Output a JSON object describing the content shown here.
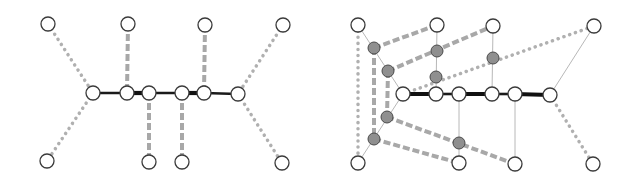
{
  "styles": {
    "thick": {
      "color": "#1a1a1a",
      "width": 2.6,
      "dash": ""
    },
    "thicker": {
      "color": "#111111",
      "width": 4.2,
      "dash": ""
    },
    "thin": {
      "color": "#b8b8b8",
      "width": 1,
      "dash": ""
    },
    "dashed": {
      "color": "#a8a8a8",
      "width": 4,
      "dash": "7 3"
    },
    "dotted": {
      "color": "#b0b0b0",
      "width": 3.5,
      "dash": "0.1 6",
      "cap": "round"
    }
  },
  "node_radius": 7,
  "aux_node_radius": 6,
  "diagrams": [
    {
      "name": "left-graph",
      "nodes": [
        {
          "id": "t1",
          "x": 48,
          "y": 24,
          "type": "open"
        },
        {
          "id": "t2",
          "x": 128,
          "y": 24,
          "type": "open"
        },
        {
          "id": "t3",
          "x": 205,
          "y": 25,
          "type": "open"
        },
        {
          "id": "t4",
          "x": 283,
          "y": 25,
          "type": "open"
        },
        {
          "id": "m1",
          "x": 93,
          "y": 93,
          "type": "open"
        },
        {
          "id": "m2",
          "x": 127,
          "y": 93,
          "type": "open"
        },
        {
          "id": "m3",
          "x": 149,
          "y": 93,
          "type": "open"
        },
        {
          "id": "m4",
          "x": 182,
          "y": 93,
          "type": "open"
        },
        {
          "id": "m5",
          "x": 204,
          "y": 93,
          "type": "open"
        },
        {
          "id": "m6",
          "x": 238,
          "y": 94,
          "type": "open"
        },
        {
          "id": "b1",
          "x": 47,
          "y": 161,
          "type": "open"
        },
        {
          "id": "b2",
          "x": 149,
          "y": 162,
          "type": "open"
        },
        {
          "id": "b3",
          "x": 182,
          "y": 162,
          "type": "open"
        },
        {
          "id": "b4",
          "x": 282,
          "y": 163,
          "type": "open"
        }
      ],
      "edges": [
        {
          "from": "m1",
          "to": "m2",
          "style": "thick"
        },
        {
          "from": "m2",
          "to": "m3",
          "style": "thicker"
        },
        {
          "from": "m3",
          "to": "m4",
          "style": "thick"
        },
        {
          "from": "m4",
          "to": "m5",
          "style": "thicker"
        },
        {
          "from": "m5",
          "to": "m6",
          "style": "thick"
        },
        {
          "from": "t1",
          "to": "m1",
          "style": "dotted"
        },
        {
          "from": "m1",
          "to": "b1",
          "style": "dotted"
        },
        {
          "from": "t4",
          "to": "m6",
          "style": "dotted"
        },
        {
          "from": "m6",
          "to": "b4",
          "style": "dotted"
        },
        {
          "from": "t2",
          "to": "m2",
          "style": "dashed"
        },
        {
          "from": "t3",
          "to": "m5",
          "style": "dashed"
        },
        {
          "from": "m3",
          "to": "b2",
          "style": "dashed"
        },
        {
          "from": "m4",
          "to": "b3",
          "style": "dashed"
        }
      ]
    },
    {
      "name": "right-graph",
      "nodes": [
        {
          "id": "t1",
          "x": 358,
          "y": 25,
          "type": "open"
        },
        {
          "id": "t2",
          "x": 437,
          "y": 25,
          "type": "open"
        },
        {
          "id": "t3",
          "x": 493,
          "y": 26,
          "type": "open"
        },
        {
          "id": "t4",
          "x": 594,
          "y": 26,
          "type": "open"
        },
        {
          "id": "m1",
          "x": 403,
          "y": 94,
          "type": "open"
        },
        {
          "id": "m2",
          "x": 436,
          "y": 94,
          "type": "open"
        },
        {
          "id": "m3",
          "x": 459,
          "y": 94,
          "type": "open"
        },
        {
          "id": "m4",
          "x": 492,
          "y": 94,
          "type": "open"
        },
        {
          "id": "m5",
          "x": 515,
          "y": 94,
          "type": "open"
        },
        {
          "id": "m6",
          "x": 550,
          "y": 95,
          "type": "open"
        },
        {
          "id": "b1",
          "x": 358,
          "y": 163,
          "type": "open"
        },
        {
          "id": "b2",
          "x": 459,
          "y": 163,
          "type": "open"
        },
        {
          "id": "b3",
          "x": 515,
          "y": 164,
          "type": "open"
        },
        {
          "id": "b4",
          "x": 593,
          "y": 164,
          "type": "open"
        },
        {
          "id": "g1",
          "x": 374,
          "y": 48,
          "type": "aux"
        },
        {
          "id": "g2",
          "x": 388,
          "y": 71,
          "type": "aux"
        },
        {
          "id": "g3",
          "x": 437,
          "y": 51,
          "type": "aux"
        },
        {
          "id": "g4",
          "x": 436,
          "y": 77,
          "type": "aux"
        },
        {
          "id": "g5",
          "x": 493,
          "y": 58,
          "type": "aux"
        },
        {
          "id": "g6",
          "x": 387,
          "y": 117,
          "type": "aux"
        },
        {
          "id": "g7",
          "x": 374,
          "y": 139,
          "type": "aux"
        },
        {
          "id": "g8",
          "x": 459,
          "y": 143,
          "type": "aux"
        }
      ],
      "edges": [
        {
          "from": "t1",
          "to": "b1",
          "style": "dotted"
        },
        {
          "from": "g1",
          "to": "g7",
          "style": "dashed"
        },
        {
          "from": "g2",
          "to": "g6",
          "style": "dashed"
        },
        {
          "from": "t1",
          "to": "m1",
          "style": "thin"
        },
        {
          "from": "m1",
          "to": "b1",
          "style": "thin"
        },
        {
          "from": "t2",
          "to": "m2",
          "style": "thin"
        },
        {
          "from": "t3",
          "to": "m4",
          "style": "thin"
        },
        {
          "from": "m3",
          "to": "b2",
          "style": "thin"
        },
        {
          "from": "m5",
          "to": "b3",
          "style": "thin"
        },
        {
          "from": "m6",
          "to": "t4",
          "style": "thin"
        },
        {
          "from": "g1",
          "to": "t2",
          "style": "dashed"
        },
        {
          "from": "g2",
          "to": "t3",
          "style": "dashed"
        },
        {
          "from": "g6",
          "to": "b3",
          "style": "dashed"
        },
        {
          "from": "g7",
          "to": "b2",
          "style": "dashed"
        },
        {
          "from": "m1",
          "to": "t4",
          "style": "dotted"
        },
        {
          "from": "m6",
          "to": "b4",
          "style": "dotted"
        },
        {
          "from": "m1",
          "to": "m2",
          "style": "thicker"
        },
        {
          "from": "m2",
          "to": "m3",
          "style": "thick"
        },
        {
          "from": "m3",
          "to": "m4",
          "style": "thicker"
        },
        {
          "from": "m4",
          "to": "m5",
          "style": "thick"
        },
        {
          "from": "m5",
          "to": "m6",
          "style": "thicker"
        }
      ]
    }
  ]
}
